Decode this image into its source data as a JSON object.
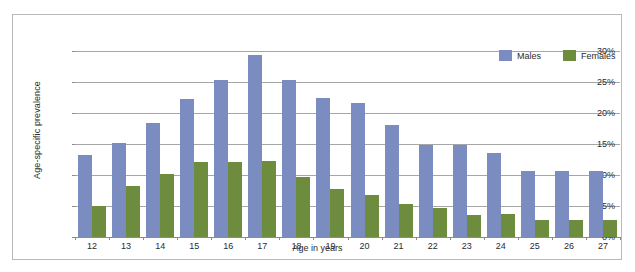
{
  "chart_data": {
    "type": "bar",
    "title": "",
    "xlabel": "Age in years",
    "ylabel": "Age-specific prevalence",
    "categories": [
      "12",
      "13",
      "14",
      "15",
      "16",
      "17",
      "18",
      "19",
      "20",
      "21",
      "22",
      "23",
      "24",
      "25",
      "26",
      "27"
    ],
    "series": [
      {
        "name": "Males",
        "color": "#7b8cc0",
        "values": [
          13.2,
          15.2,
          18.4,
          22.3,
          25.3,
          29.3,
          25.4,
          22.5,
          21.6,
          18.0,
          14.9,
          14.9,
          13.5,
          10.6,
          10.6,
          10.7
        ]
      },
      {
        "name": "Females",
        "color": "#6d8c3e",
        "values": [
          5.0,
          8.2,
          10.1,
          12.1,
          12.1,
          12.2,
          9.6,
          7.7,
          6.7,
          5.4,
          4.6,
          3.6,
          3.7,
          2.7,
          2.7,
          2.7
        ]
      }
    ],
    "ylim": [
      0,
      30
    ],
    "ytick_labels": [
      "0%",
      "5%",
      "10%",
      "15%",
      "20%",
      "25%",
      "30%"
    ],
    "ytick_values": [
      0,
      5,
      10,
      15,
      20,
      25,
      30
    ],
    "grid": true,
    "legend_position": "top-right"
  }
}
